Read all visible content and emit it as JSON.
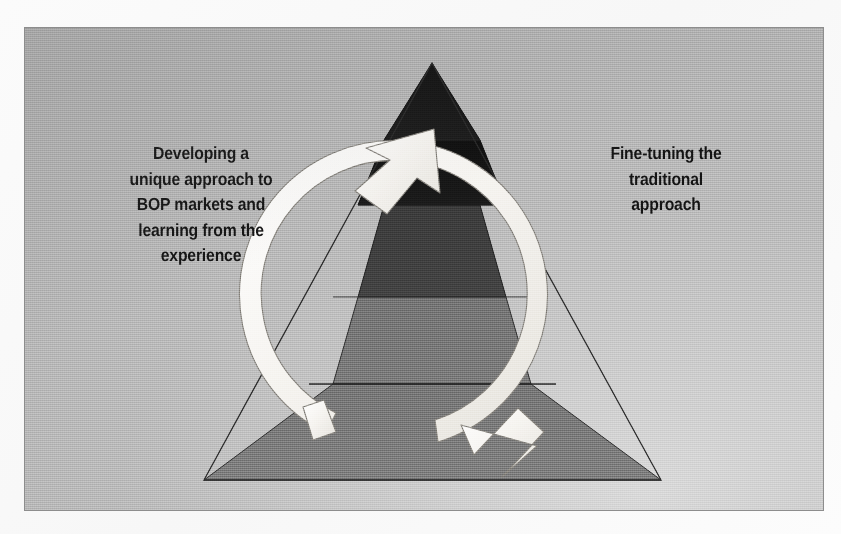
{
  "figure": {
    "kind": "pyramid-cycle-diagram",
    "background_color": "#b4b4b4",
    "border_color": "#8d8d8d",
    "arrow_color": "#f4f2ee",
    "arrow_outline_color": "#6a6a6a",
    "text_color": "#121212"
  },
  "callouts": {
    "left": {
      "name": "developing-unique-approach",
      "lines": [
        "Developing a",
        "unique approach to",
        "BOP markets and",
        "learning from the",
        "experience"
      ]
    },
    "right": {
      "name": "fine-tuning-traditional-approach",
      "lines": [
        "Fine-tuning the",
        "traditional",
        "approach"
      ]
    }
  },
  "pyramid": {
    "name": "bop-pyramid",
    "apex": {
      "x": 431,
      "y": 62
    },
    "base_left": {
      "x": 203,
      "y": 479
    },
    "base_right": {
      "x": 660,
      "y": 479
    },
    "tiers": [
      {
        "name": "tier-top",
        "fill": "#141414",
        "top_y": 62,
        "bottom_y": 204
      },
      {
        "name": "tier-upper-middle",
        "fill": "#3a3a3a",
        "top_y": 204,
        "bottom_y": 296
      },
      {
        "name": "tier-lower-middle",
        "fill": "#6e6e6e",
        "top_y": 296,
        "bottom_y": 383
      },
      {
        "name": "tier-base",
        "fill": "#6e6e6e",
        "top_y": 383,
        "bottom_y": 479
      }
    ],
    "divider_color": "#232323"
  },
  "cycle_arrow": {
    "name": "cycle-arrow",
    "direction": "counterclockwise",
    "center": {
      "x": 422,
      "y": 287
    },
    "outer_radius": 154,
    "band_width": 21,
    "head_top": {
      "x": 432,
      "y": 128,
      "points": "up-right"
    },
    "head_bottom": {
      "x": 532,
      "y": 442,
      "points": "down-right"
    },
    "tail": {
      "x": 325,
      "y": 432
    }
  }
}
